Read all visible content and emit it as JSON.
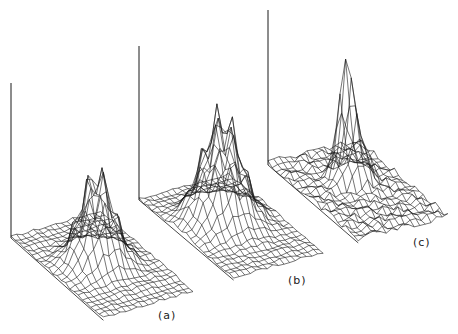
{
  "figure": {
    "panels": [
      {
        "id": "a",
        "label": "(a)",
        "label_pos": [
          158,
          309
        ],
        "axis_origin": [
          11,
          238
        ],
        "axis_top": 83,
        "grid": {
          "nx": 22,
          "ny": 16,
          "ex": [
            4.2,
            3.65
          ],
          "ey": [
            5.6,
            1.65
          ]
        },
        "peak": {
          "cx": 10.5,
          "cy": 7.5,
          "sx": 2.2,
          "sy": 2.6,
          "height": 105,
          "bumps": 4,
          "noise": 3.5,
          "sharp": 0
        }
      },
      {
        "id": "b",
        "label": "(b)",
        "label_pos": [
          288,
          274
        ],
        "axis_origin": [
          139,
          200
        ],
        "axis_top": 46,
        "grid": {
          "nx": 22,
          "ny": 16,
          "ex": [
            4.3,
            3.55
          ],
          "ey": [
            5.6,
            1.55
          ]
        },
        "peak": {
          "cx": 9.5,
          "cy": 7.5,
          "sx": 2.6,
          "sy": 3.0,
          "height": 120,
          "bumps": 2,
          "noise": 3.5,
          "sharp": 0
        }
      },
      {
        "id": "c",
        "label": "(c)",
        "label_pos": [
          413,
          236
        ],
        "axis_origin": [
          268,
          165
        ],
        "axis_top": 10,
        "grid": {
          "nx": 22,
          "ny": 16,
          "ex": [
            4.1,
            3.45
          ],
          "ey": [
            5.6,
            1.4
          ]
        },
        "peak": {
          "cx": 8.0,
          "cy": 8.0,
          "sx": 0.9,
          "sy": 1.2,
          "height": 92,
          "bumps": 0,
          "noise": 9,
          "sharp": 1
        }
      }
    ],
    "colors": {
      "line": "#1a1a1a",
      "background": "#ffffff",
      "label": "#222222"
    }
  }
}
